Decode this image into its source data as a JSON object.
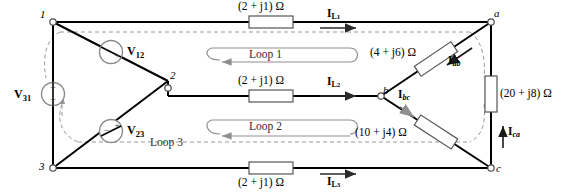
{
  "figure": {
    "type": "circuit-diagram"
  },
  "nodes": [
    {
      "id": "n1",
      "label": "1",
      "x": 48,
      "y": 22
    },
    {
      "id": "n2",
      "label": "2",
      "x": 168,
      "y": 81
    },
    {
      "id": "n3",
      "label": "3",
      "x": 48,
      "y": 168
    },
    {
      "id": "na",
      "label": "a",
      "x": 491,
      "y": 22
    },
    {
      "id": "nb",
      "label": "b",
      "x": 381,
      "y": 96
    },
    {
      "id": "nc",
      "label": "c",
      "x": 491,
      "y": 171
    }
  ],
  "impedances": [
    {
      "id": "z-line1",
      "label": "(2 + j1) Ω",
      "real": 2,
      "imag": 1,
      "branch": "1-a"
    },
    {
      "id": "z-line2",
      "label": "(2 + j1) Ω",
      "real": 2,
      "imag": 1,
      "branch": "2-b"
    },
    {
      "id": "z-line3",
      "label": "(2 + j1) Ω",
      "real": 2,
      "imag": 1,
      "branch": "3-c"
    },
    {
      "id": "z-ab",
      "label": "(4 + j6) Ω",
      "real": 4,
      "imag": 6,
      "branch": "a-b"
    },
    {
      "id": "z-bc",
      "label": "(10 + j4) Ω",
      "real": 10,
      "imag": 4,
      "branch": "b-c"
    },
    {
      "id": "z-ca",
      "label": "(20 + j8) Ω",
      "real": 20,
      "imag": 8,
      "branch": "c-a"
    }
  ],
  "currents": [
    {
      "id": "i-l1",
      "base": "I",
      "sub": "L",
      "sub2": "1",
      "direction": "right"
    },
    {
      "id": "i-l2",
      "base": "I",
      "sub": "L",
      "sub2": "2",
      "direction": "right"
    },
    {
      "id": "i-l3",
      "base": "I",
      "sub": "L",
      "sub2": "3",
      "direction": "right"
    },
    {
      "id": "i-ab",
      "base": "I",
      "sub": "ab",
      "direction": "down-left"
    },
    {
      "id": "i-bc",
      "base": "I",
      "sub": "bc",
      "direction": "down-right"
    },
    {
      "id": "i-ca",
      "base": "I",
      "sub": "ca",
      "direction": "up"
    }
  ],
  "sources": [
    {
      "id": "v12",
      "base": "V",
      "sub": "12",
      "orientation": "diagonal",
      "plus": "+",
      "minus": "−"
    },
    {
      "id": "v23",
      "base": "V",
      "sub": "23",
      "orientation": "diagonal",
      "plus": "+",
      "minus": "−"
    },
    {
      "id": "v31",
      "base": "V",
      "sub": "31",
      "orientation": "vertical",
      "plus": "+",
      "minus": "−"
    }
  ],
  "loops": [
    {
      "id": "loop1",
      "label": "Loop 1",
      "x": 248,
      "y": 57
    },
    {
      "id": "loop2",
      "label": "Loop 2",
      "x": 248,
      "y": 118
    },
    {
      "id": "loop3",
      "label": "Loop 3",
      "x": 151,
      "y": 144
    }
  ],
  "labels": {
    "z_line1": "(2 + j1) Ω",
    "z_line2": "(2 + j1) Ω",
    "z_line3": "(2 + j1) Ω",
    "z_ab": "(4 + j6) Ω",
    "z_bc": "(10 + j4) Ω",
    "z_ca": "(20 + j8) Ω",
    "node1": "1",
    "node2": "2",
    "node3": "3",
    "nodea": "a",
    "nodeb": "b",
    "nodec": "c",
    "loop1": "Loop 1",
    "loop2": "Loop 2",
    "loop3": "Loop 3",
    "v12": "V",
    "v12_sub": "12",
    "v23": "V",
    "v23_sub": "23",
    "v31": "V",
    "v31_sub": "31",
    "il1": "I",
    "il1_sub": "L",
    "il1_sub2": "1",
    "il2": "I",
    "il2_sub": "L",
    "il2_sub2": "2",
    "il3": "I",
    "il3_sub": "L",
    "il3_sub2": "3",
    "iab": "I",
    "iab_sub": "ab",
    "ibc": "I",
    "ibc_sub": "bc",
    "ica": "I",
    "ica_sub": "ca",
    "plus": "+",
    "minus": "−"
  },
  "colors": {
    "wire": "#000000",
    "dashed": "#9a9a9a",
    "loop_arrow": "#8c8c8c",
    "resistor_fill": "#ffffff",
    "resistor_stroke": "#555555",
    "node_fill": "#ffffff",
    "node_stroke": "#4a4a4a",
    "source_stroke": "#8a8a8a",
    "text": "#000000"
  }
}
